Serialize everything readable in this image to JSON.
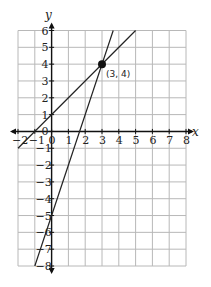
{
  "chart_data": {
    "type": "line",
    "title": "",
    "xlabel": "x",
    "ylabel": "y",
    "xlim": [
      -2,
      8
    ],
    "ylim": [
      -8,
      6
    ],
    "grid": true,
    "x_ticks": [
      "-2",
      "-1",
      "0",
      "1",
      "2",
      "3",
      "4",
      "5",
      "6",
      "7",
      "8"
    ],
    "y_ticks": [
      "6",
      "5",
      "4",
      "3",
      "2",
      "1",
      "0",
      "-1",
      "-2",
      "-3",
      "-4",
      "-5",
      "-6",
      "-7",
      "-8"
    ],
    "series": [
      {
        "name": "line 1 (y = x + 1)",
        "x": [
          -2,
          5
        ],
        "y": [
          -1,
          6
        ]
      },
      {
        "name": "line 2 (y = 3x - 5)",
        "x": [
          -1,
          3.667
        ],
        "y": [
          -8,
          6
        ]
      }
    ],
    "annotations": [
      {
        "text": "(3, 4)",
        "x": 3,
        "y": 4,
        "marker": "filled-circle"
      }
    ]
  },
  "labels": {
    "x_axis": "x",
    "y_axis": "y",
    "point": "(3, 4)"
  }
}
